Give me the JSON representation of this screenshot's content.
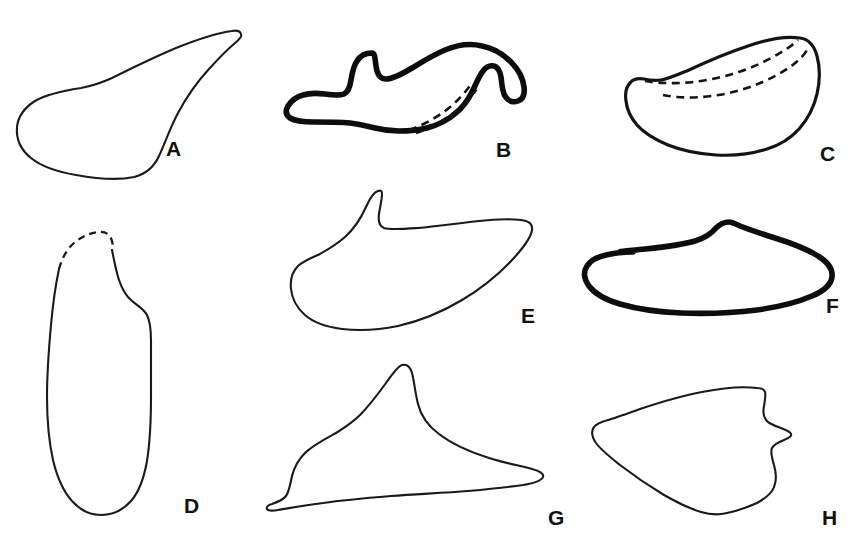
{
  "figure": {
    "type": "scientific-line-drawing-plate",
    "background_color": "#ffffff",
    "ink_color": "#111111",
    "width": 865,
    "height": 558,
    "panel_count": 8
  },
  "panels": [
    {
      "id": "panel-a",
      "label": "A",
      "label_x": 166,
      "label_y": 138,
      "shape": "elongated teardrop with long tapering spine extending to upper right",
      "line_weight": "thin",
      "has_dashed_internal_lines": false,
      "has_dashed_outline": false,
      "outline": "M 232 31 C 216 33 196 40 176 48 C 150 59 128 70 112 78 C 101 83 92 86 81 88 C 62 91 45 95 35 101 C 24 108 18 117 17 127 C 16 139 21 150 31 158 C 42 167 58 172 76 175 C 98 179 120 180 134 177 C 146 174 154 167 159 156 C 165 143 170 128 178 113 C 186 98 197 82 209 69 C 219 58 228 49 235 43 C 240 39 242 36 241 34 C 240 31 237 30 232 31 Z"
    },
    {
      "id": "panel-b",
      "label": "B",
      "label_x": 496,
      "label_y": 139,
      "shape": "thick-outlined dorsal fin form with notched crest and two dashed internal lines in the right hook",
      "line_weight": "thick",
      "has_dashed_internal_lines": true,
      "has_dashed_outline": false,
      "outline": "M 372 53 C 365 53 360 56 357 61 C 353 67 352 74 351 80 C 350 87 348 92 344 94 C 339 96 332 95 325 94 C 317 93 309 93 303 95 C 296 97 291 101 288 106 C 285 111 286 115 290 118 C 295 121 304 122 314 122 C 326 122 339 122 350 123 C 359 124 367 126 375 128 C 383 130 391 131 399 131 C 409 131 419 130 427 128 C 438 125 448 120 456 113 C 463 107 468 100 472 92 C 476 84 479 76 483 71 C 486 67 490 65 494 66 C 498 67 500 71 501 77 C 502 84 502 91 505 96 C 508 101 513 103 518 101 C 523 99 525 94 524 87 C 523 78 518 69 511 62 C 503 54 493 48 482 46 C 470 43 457 45 445 50 C 433 55 422 62 412 68 C 402 74 393 79 386 79 C 380 79 377 74 376 66 C 375 59 375 53 372 53 Z",
      "inner_dashed_lines": [
        "M 409 130 C 421 126 434 119 445 111 C 456 103 465 93 471 84",
        "M 416 133 C 428 129 441 122 452 114 C 463 106 472 96 478 87"
      ]
    },
    {
      "id": "panel-c",
      "label": "C",
      "label_x": 820,
      "label_y": 143,
      "shape": "rounded asymmetric leaf form with two long dashed growth lines along the dorsal margin",
      "line_weight": "medium",
      "has_dashed_internal_lines": true,
      "has_dashed_outline": false,
      "outline": "M 800 38 C 786 36 768 39 748 46 C 727 53 706 62 689 70 C 677 75 668 79 661 80 C 654 81 648 80 644 79 C 638 78 633 79 630 83 C 626 87 625 94 626 101 C 627 110 631 118 637 125 C 645 134 656 140 668 145 C 683 151 700 154 716 155 C 734 156 752 154 767 149 C 780 145 791 138 799 129 C 808 119 814 107 817 94 C 820 81 820 67 817 56 C 814 45 808 39 800 38 Z",
      "inner_dashed_lines": [
        "M 645 81 C 662 84 684 84 707 80 C 730 76 753 68 771 58 C 784 51 793 45 798 40",
        "M 663 95 C 682 99 706 98 729 93 C 752 88 774 78 790 67 C 800 60 806 53 808 48"
      ]
    },
    {
      "id": "panel-d",
      "label": "D",
      "label_x": 184,
      "label_y": 495,
      "shape": "tall vertical ovate form with a dashed incomplete upper-left margin and a shoulder notch on the right",
      "line_weight": "thin",
      "has_dashed_internal_lines": false,
      "has_dashed_outline": true,
      "outline_solid": "M 112 250 C 114 260 116 271 119 280 C 122 289 126 296 132 301 C 138 306 144 309 147 315 C 150 321 151 330 151 341 C 151 357 151 376 151 396 C 151 419 150 442 147 461 C 144 478 139 492 131 501 C 123 510 112 515 101 515 C 90 515 80 510 72 501 C 63 491 57 477 53 460 C 49 442 47 420 47 397 C 47 372 49 347 51 325 C 53 303 56 283 59 269",
      "outline_dashed": "M 59 269 C 62 258 67 249 74 243 C 81 237 90 233 98 232 C 105 231 110 234 112 241 C 113 245 113 248 112 250"
    },
    {
      "id": "panel-e",
      "label": "E",
      "label_x": 521,
      "label_y": 305,
      "shape": "broad wing form with a tall sharp spine at upper left and concave sweeping lower margin",
      "line_weight": "thin",
      "has_dashed_internal_lines": false,
      "has_dashed_outline": false,
      "outline": "M 378 191 C 374 192 370 198 366 207 C 361 218 354 229 345 237 C 336 245 327 250 320 254 C 311 258 303 261 298 266 C 292 272 290 280 291 289 C 292 299 297 308 305 315 C 314 323 327 327 342 329 C 359 331 379 330 398 326 C 420 321 442 312 462 300 C 482 288 500 273 513 259 C 524 247 531 237 532 230 C 533 224 529 221 521 220 C 511 219 496 219 479 221 C 460 223 438 226 418 228 C 403 229 390 230 384 228 C 379 226 378 221 379 214 C 380 207 382 199 382 194 C 382 191 381 190 378 191 Z"
    },
    {
      "id": "panel-f",
      "label": "F",
      "label_x": 826,
      "label_y": 295,
      "shape": "thick-outlined low lenticular form with a small apex peak at top center",
      "line_weight": "thick",
      "has_dashed_internal_lines": false,
      "has_dashed_outline": false,
      "outline": "M 729 222 C 723 222 719 225 716 228 C 711 234 705 238 695 241 C 682 245 664 247 645 249 C 626 251 607 252 633 252 C 624 252 614 253 606 255 C 597 257 590 261 587 266 C 583 272 584 279 589 286 C 595 294 606 300 620 304 C 637 309 658 312 681 313 C 706 314 733 313 757 310 C 779 307 798 302 812 296 C 824 291 831 284 832 277 C 833 269 828 262 818 256 C 807 249 791 243 775 238 C 760 233 747 229 740 226 C 734 223 731 222 729 222 Z"
    },
    {
      "id": "panel-g",
      "label": "G",
      "label_x": 548,
      "label_y": 507,
      "shape": "three-pointed shark-fin form with tall apex, left lateral spur and long tapering right tail",
      "line_weight": "thin",
      "has_dashed_internal_lines": false,
      "has_dashed_outline": false,
      "outline": "M 402 365 C 399 366 393 373 386 383 C 378 394 369 406 360 415 C 352 423 344 428 336 433 C 325 439 313 445 305 453 C 298 460 294 468 292 476 C 290 485 289 492 286 496 C 283 500 278 502 272 504 C 268 505 266 507 267 509 C 268 511 272 511 278 510 C 290 508 306 505 323 503 C 344 500 367 498 391 496 C 417 494 444 493 468 491 C 490 489 509 487 523 485 C 535 483 542 480 543 477 C 544 474 540 471 532 469 C 521 466 505 463 489 458 C 470 452 452 444 439 434 C 428 426 421 416 418 404 C 415 392 414 380 412 373 C 410 366 406 364 402 365 Z"
    },
    {
      "id": "panel-h",
      "label": "H",
      "label_x": 822,
      "label_y": 507,
      "shape": "broad wedge form with blunt left point and scalloped stepped right margin",
      "line_weight": "thin",
      "has_dashed_internal_lines": false,
      "has_dashed_outline": false,
      "outline": "M 757 388 C 742 386 722 388 702 392 C 680 396 658 403 640 409 C 626 414 615 418 608 420 C 601 422 596 424 594 427 C 591 431 592 437 596 443 C 601 450 610 457 620 465 C 633 475 649 486 664 495 C 678 503 691 509 701 512 C 711 515 719 515 727 513 C 737 511 748 507 757 503 C 766 498 772 493 774 487 C 777 480 776 472 774 465 C 772 458 770 452 772 448 C 774 444 779 442 784 440 C 789 438 792 436 791 434 C 790 431 786 430 781 428 C 775 426 769 424 766 420 C 763 416 763 411 764 406 C 765 400 766 395 765 392 C 764 389 761 388 757 388 Z"
    }
  ]
}
